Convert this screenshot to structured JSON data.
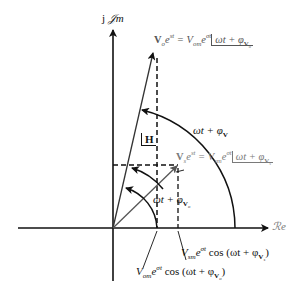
{
  "diagram": {
    "type": "phasor-diagram",
    "axes": {
      "imag_label_prefix": "j",
      "imag_label_script": "𝒥m",
      "real_label": "ℛe"
    },
    "vectors": {
      "output": {
        "bold": "V",
        "sub": "o",
        "exp": "e",
        "exp_sup": "st",
        "eq": " = V",
        "mag_sub": "om",
        "mag_exp": "e",
        "mag_exp_sup": "σt",
        "angle": "ωt + φ",
        "angle_sub_bold": "V",
        "angle_sub_sub": "o"
      },
      "source": {
        "bold": "V",
        "sub": "s",
        "exp": "e",
        "exp_sup": "st",
        "eq": " = V",
        "mag_sub": "sm",
        "mag_exp": "e",
        "mag_exp_sup": "σt",
        "angle": "ωt + φ",
        "angle_sub_bold": "V",
        "angle_sub_sub": "s"
      }
    },
    "angle_labels": {
      "h_angle": "H",
      "phi_v": "ωt + φ",
      "phi_v_sub": "V",
      "phi_vo": "ωt + φ",
      "phi_vo_sub_bold": "V",
      "phi_vo_sub_sub": "o"
    },
    "projections": {
      "source": {
        "mag": "V",
        "mag_sub": "sm",
        "exp": "e",
        "exp_sup": "σt",
        "func": " cos (ωt + φ",
        "sub_bold": "V",
        "sub_sub": "s",
        "close": ")"
      },
      "output": {
        "mag": "V",
        "mag_sub": "om",
        "exp": "e",
        "exp_sup": "σt",
        "func": " cos (ωt + φ",
        "sub_bold": "V",
        "sub_sub": "o",
        "close": ")"
      }
    },
    "colors": {
      "primary": "#111111",
      "secondary": "#7a7a7a"
    }
  }
}
